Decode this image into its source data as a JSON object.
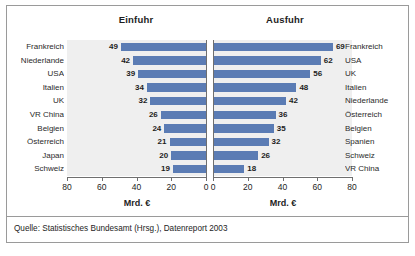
{
  "figure": {
    "source_note": "Quelle: Statistisches Bundesamt (Hrsg.), Datenreport 2003"
  },
  "panels": {
    "left": {
      "title": "Einfuhr",
      "axis_caption": "Mrd. €",
      "ticks": [
        "80",
        "60",
        "40",
        "20",
        "0"
      ]
    },
    "right": {
      "title": "Ausfuhr",
      "axis_caption": "Mrd. €",
      "ticks": [
        "0",
        "20",
        "40",
        "60",
        "80"
      ]
    }
  },
  "chart_data": [
    {
      "type": "bar",
      "orientation": "horizontal",
      "title": "Einfuhr",
      "xlabel": "Mrd. €",
      "ylabel": "",
      "xlim": [
        0,
        80
      ],
      "direction": "right-to-left",
      "grid": false,
      "categories": [
        "Frankreich",
        "Niederlande",
        "USA",
        "Italien",
        "UK",
        "VR China",
        "Belgien",
        "Österreich",
        "Japan",
        "Schweiz"
      ],
      "values": [
        49,
        42,
        39,
        34,
        32,
        26,
        24,
        21,
        20,
        19
      ],
      "tick_values": [
        80,
        60,
        40,
        20,
        0
      ]
    },
    {
      "type": "bar",
      "orientation": "horizontal",
      "title": "Ausfuhr",
      "xlabel": "Mrd. €",
      "ylabel": "",
      "xlim": [
        0,
        80
      ],
      "direction": "left-to-right",
      "grid": false,
      "categories": [
        "Frankreich",
        "USA",
        "UK",
        "Italien",
        "Niederlande",
        "Österreich",
        "Belgien",
        "Spanien",
        "Schweiz",
        "VR China"
      ],
      "values": [
        69,
        62,
        56,
        48,
        42,
        36,
        35,
        32,
        26,
        18
      ],
      "tick_values": [
        0,
        20,
        40,
        60,
        80
      ]
    }
  ],
  "colors": {
    "bar": "#5b7cb4",
    "plot_background": "#efefef",
    "frame": "#9a9a9a",
    "axis": "#6f6f6f",
    "text": "#1d1d1d"
  }
}
